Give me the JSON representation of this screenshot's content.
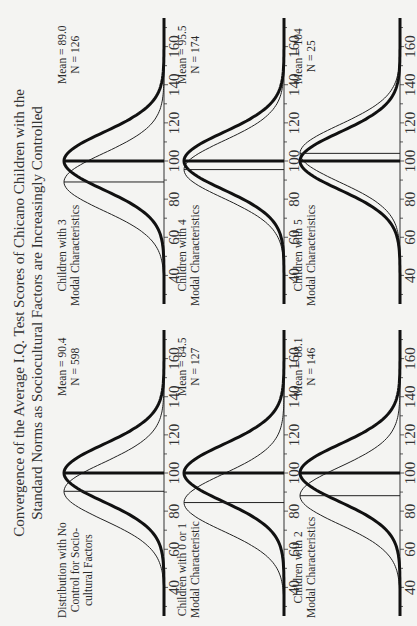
{
  "title": {
    "line1": "Convergence of the Average I.Q. Test Scores of Chicano Children with the",
    "line2": "Standard Norms as Sociocultural Factors are Increasingly Controlled"
  },
  "panels": [
    {
      "label": [
        "Distribution with No",
        "Control for Socio-",
        "cultural Factors"
      ],
      "mean_text": "Mean = 90.4",
      "n_text": "N = 598"
    },
    {
      "label": [
        "Children with 3",
        "Modal Characteristics"
      ],
      "mean_text": "Mean = 89.0",
      "n_text": "N = 126"
    },
    {
      "label": [
        "Children with 0 or 1",
        "Modal Characteristic"
      ],
      "mean_text": "Mean = 84.5",
      "n_text": "N = 127"
    },
    {
      "label": [
        "Children with 4",
        "Modal Characteristics"
      ],
      "mean_text": "Mean = 95.5",
      "n_text": "N = 174"
    },
    {
      "label": [
        "Children with 2",
        "Modal Characteristics"
      ],
      "mean_text": "Mean = 88.1",
      "n_text": "N = 146"
    },
    {
      "label": [
        "Children with 5",
        "Modal Characteristics"
      ],
      "mean_text": "Mean = 104",
      "n_text": "N = 25"
    }
  ],
  "axis_ticks": [
    "40",
    "60",
    "80",
    "100",
    "120",
    "140",
    "160"
  ],
  "chart_data": {
    "type": "line",
    "title": "Convergence of the Average I.Q. Test Scores of Chicano Children with the Standard Norms as Sociocultural Factors are Increasingly Controlled",
    "xlabel": "I.Q. score",
    "ylabel": "",
    "xlim": [
      25,
      175
    ],
    "x_ticks": [
      40,
      60,
      80,
      100,
      120,
      140,
      160
    ],
    "grid": false,
    "legend": "none (thick curve = standard norm, mean 100; thin curve = Chicano sample distribution)",
    "layout": "3 rows x 2 columns of small multiples",
    "reference": {
      "name": "Standard norm",
      "mean": 100,
      "sd": 15
    },
    "series": [
      {
        "name": "Distribution with No Control for Sociocultural Factors",
        "mean": 90.4,
        "n": 598
      },
      {
        "name": "Children with 0 or 1 Modal Characteristic",
        "mean": 84.5,
        "n": 127
      },
      {
        "name": "Children with 2 Modal Characteristics",
        "mean": 88.1,
        "n": 146
      },
      {
        "name": "Children with 3 Modal Characteristics",
        "mean": 89.0,
        "n": 126
      },
      {
        "name": "Children with 4 Modal Characteristics",
        "mean": 95.5,
        "n": 174
      },
      {
        "name": "Children with 5 Modal Characteristics",
        "mean": 104,
        "n": 25
      }
    ]
  }
}
